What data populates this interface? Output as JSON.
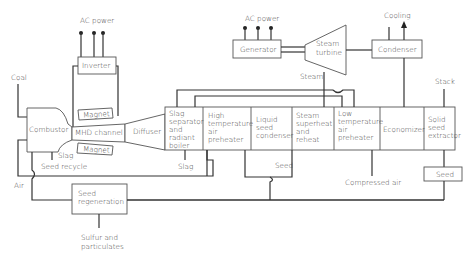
{
  "diagram": {
    "components": {
      "combustor": "Combustor",
      "mhd_channel": "MHD channel",
      "magnet_top": "Magnet",
      "magnet_bottom": "Magnet",
      "inverter": "Inverter",
      "diffuser": "Diffuser",
      "slag_separator": [
        "Slag",
        "separator",
        "and",
        "radiant",
        "boiler"
      ],
      "ht_air_preheater": [
        "High",
        "temperature",
        "air",
        "preheater"
      ],
      "liquid_seed_condenser": [
        "Liquid",
        "seed",
        "condenser"
      ],
      "steam_superheat": [
        "Steam",
        "superheat",
        "and",
        "reheat"
      ],
      "lt_air_preheater": [
        "Low",
        "temperature",
        "air",
        "preheater"
      ],
      "economizer": "Economizer",
      "solid_seed_extractor": [
        "Solid",
        "seed",
        "extractor"
      ],
      "seed_box": "Seed",
      "generator": "Generator",
      "steam_turbine": [
        "Steam",
        "turbine"
      ],
      "condenser": "Condenser",
      "seed_regeneration": [
        "Seed",
        "regeneration"
      ]
    },
    "labels": {
      "ac_power_left": "AC power",
      "ac_power_right": "AC power",
      "coal": "Coal",
      "slag_combustor": "Slag",
      "seed_recycle": "Seed recycle",
      "air": "Air",
      "slag_separator_out": "Slag",
      "seed_out": "Seed",
      "compressed_air": "Compressed air",
      "steam": "Steam",
      "cooling": "Cooling",
      "stack": "Stack",
      "sulfur": [
        "Sulfur and",
        "particulates"
      ]
    }
  }
}
